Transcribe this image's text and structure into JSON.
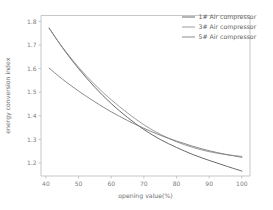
{
  "chart_data": {
    "type": "line",
    "title": "",
    "xlabel": "opening value(%)",
    "ylabel": "energy conversion index",
    "xlim": [
      38.5,
      102.5
    ],
    "ylim": [
      1.145,
      1.825
    ],
    "xticks": [
      40,
      50,
      60,
      70,
      80,
      90,
      100
    ],
    "yticks": [
      1.2,
      1.3,
      1.4,
      1.5,
      1.6,
      1.7,
      1.8
    ],
    "xtick_labels": [
      "40",
      "50",
      "60",
      "70",
      "80",
      "90",
      "100"
    ],
    "ytick_labels": [
      "1.2",
      "1.3",
      "1.4",
      "1.5",
      "1.6",
      "1.7",
      "1.8"
    ],
    "grid": false,
    "legend_position": "upper right",
    "x": [
      41,
      45,
      50,
      55,
      60,
      65,
      70,
      75,
      80,
      85,
      90,
      95,
      100
    ],
    "series": [
      {
        "name": "1# Air compressor",
        "color": "#4e4e4e",
        "values": [
          1.772,
          1.69,
          1.6,
          1.521,
          1.452,
          1.393,
          1.342,
          1.3,
          1.266,
          1.236,
          1.211,
          1.188,
          1.166
        ]
      },
      {
        "name": "3# Air compressor",
        "color": "#8c8c8c",
        "values": [
          1.77,
          1.692,
          1.606,
          1.532,
          1.468,
          1.412,
          1.362,
          1.322,
          1.29,
          1.266,
          1.248,
          1.236,
          1.228
        ]
      },
      {
        "name": "5# Air compressor",
        "color": "#767676",
        "values": [
          1.602,
          1.556,
          1.505,
          1.459,
          1.417,
          1.38,
          1.347,
          1.318,
          1.293,
          1.271,
          1.252,
          1.237,
          1.224
        ]
      }
    ]
  },
  "legend": {
    "entries": [
      {
        "label": "1# Air compressor"
      },
      {
        "label": "3# Air compressor"
      },
      {
        "label": "5# Air compressor"
      }
    ]
  },
  "axes": {
    "x_label": "opening value(%)",
    "y_label": "energy conversion index"
  },
  "colors": {
    "background": "#ffffff",
    "axis": "#b9b9b9",
    "tick_text": "#7d7d7d",
    "label_text": "#6f6f6f"
  }
}
